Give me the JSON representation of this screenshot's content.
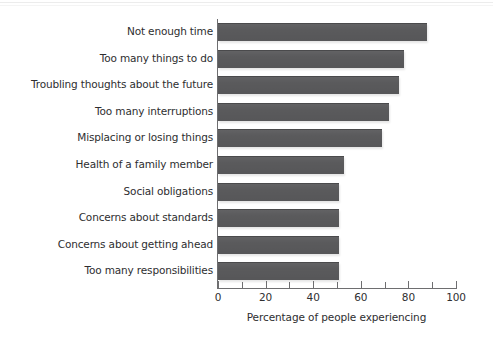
{
  "chart_data": {
    "type": "bar",
    "orientation": "horizontal",
    "title": "",
    "subtitle": "",
    "xlabel": "Percentage of people experiencing",
    "ylabel": "",
    "xlim": [
      0,
      100
    ],
    "xticks": [
      0,
      10,
      20,
      30,
      40,
      50,
      60,
      70,
      80,
      90,
      100
    ],
    "xtick_labels": [
      "0",
      "",
      "20",
      "",
      "40",
      "",
      "60",
      "",
      "80",
      "",
      "100"
    ],
    "grid": false,
    "legend": null,
    "bar_color": "#5a5a5c",
    "axis_color": "#6e6e70",
    "background_color": "#ffffff",
    "categories": [
      "Not enough time",
      "Too many things to do",
      "Troubling thoughts about the future",
      "Too many interruptions",
      "Misplacing or losing things",
      "Health of a family member",
      "Social obligations",
      "Concerns about standards",
      "Concerns about getting ahead",
      "Too many responsibilities"
    ],
    "values": [
      88,
      78,
      76,
      72,
      69,
      53,
      51,
      51,
      51,
      51
    ]
  }
}
